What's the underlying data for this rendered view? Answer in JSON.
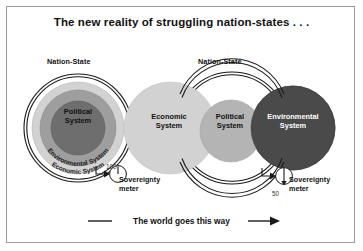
{
  "figure": {
    "title": "The new reality of struggling nation-states . . .",
    "caption": "The world goes this way",
    "border_color": "#9a9a9a",
    "background": "#ffffff"
  },
  "colors": {
    "economic_fill": "#d2d2d2",
    "environmental_fill": "#9e9e9e",
    "political_fill": "#6e6e6e",
    "environmental_dark_fill": "#4a4a4a",
    "political_mid_fill": "#b4b4b4",
    "outline": "#1a1a1a",
    "text_dark": "#111111",
    "text_light": "#ffffff"
  },
  "left_diagram": {
    "name": "nested-nation-state-model",
    "nation_state_label": "Nation-State",
    "rings": [
      {
        "label": "Economic System",
        "layer": "outer",
        "curved": true
      },
      {
        "label": "Environmental System",
        "layer": "middle",
        "curved": true
      },
      {
        "label": "Political System",
        "layer": "inner",
        "curved": false
      }
    ],
    "political_label_line1": "Political",
    "political_label_line2": "System",
    "environmental_curved_label": "Environmental System",
    "economic_curved_label": "Economic System",
    "meter": {
      "label_line1": "Sovereignty",
      "label_line2": "meter",
      "value": "100",
      "needle_direction": "up"
    }
  },
  "right_diagram": {
    "name": "overlapping-systems-model",
    "nation_state_label": "Nation-State",
    "circles": [
      {
        "label_line1": "Economic",
        "label_line2": "System",
        "shade": "light"
      },
      {
        "label_line1": "Political",
        "label_line2": "System",
        "shade": "medium"
      },
      {
        "label_line1": "Environmental",
        "label_line2": "System",
        "shade": "dark"
      }
    ],
    "economic_label_line1": "Economic",
    "economic_label_line2": "System",
    "political_label_line1": "Political",
    "political_label_line2": "System",
    "environmental_label_line1": "Environmental",
    "environmental_label_line2": "System",
    "meter": {
      "label_line1": "Sovereignty",
      "label_line2": "meter",
      "value": "50",
      "needle_direction": "down"
    }
  }
}
